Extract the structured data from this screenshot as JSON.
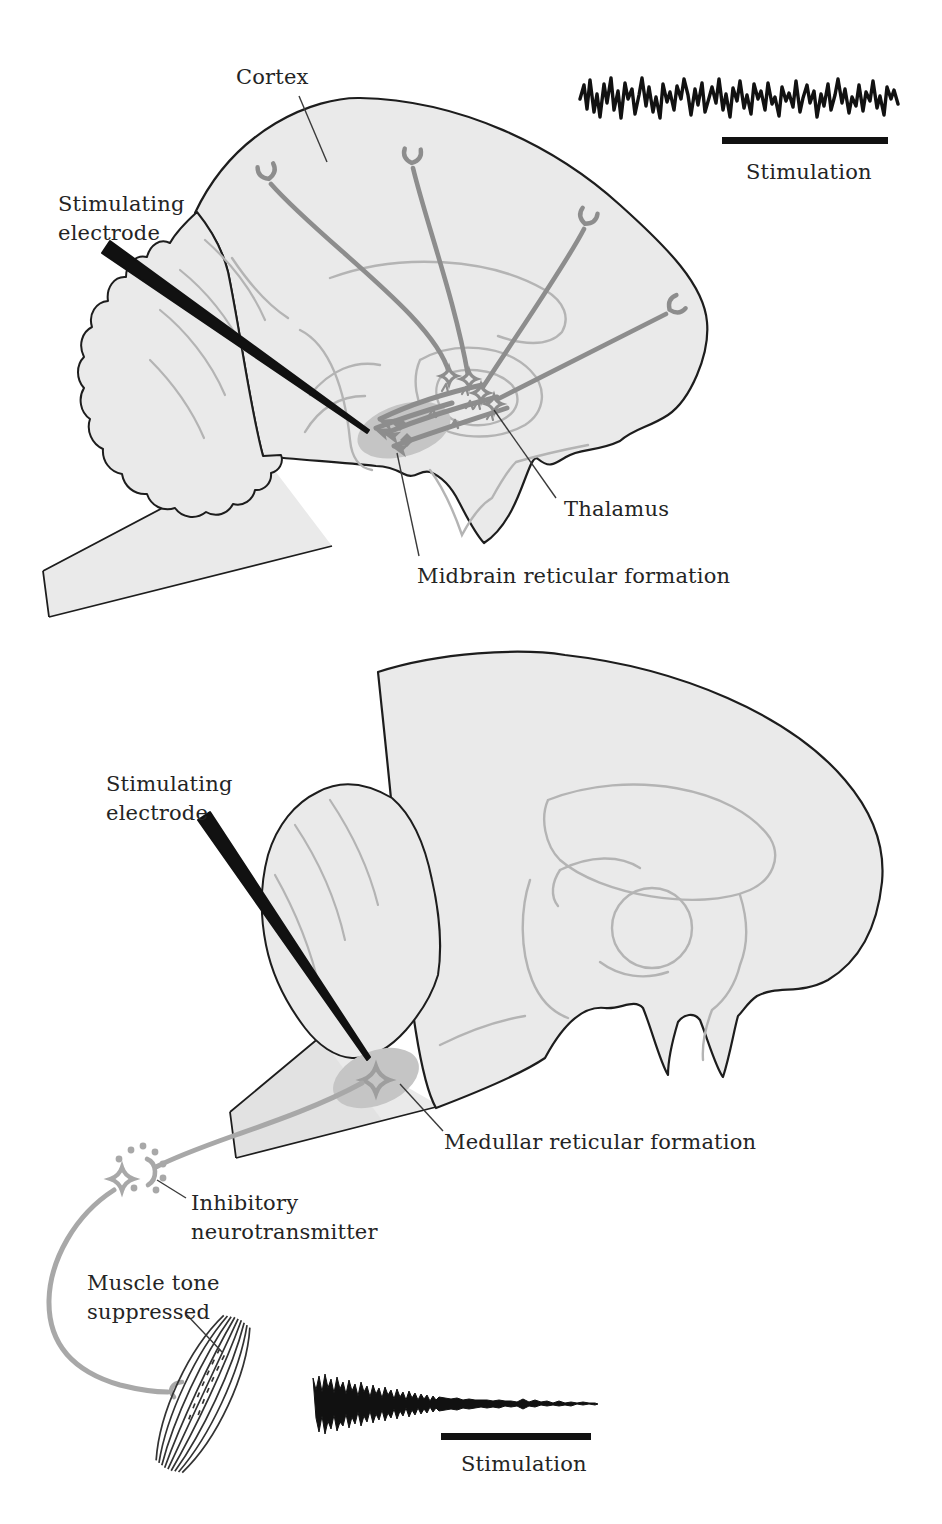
{
  "figure": {
    "type": "textbook-anatomy-diagram",
    "colors": {
      "background": "#ffffff",
      "brain_fill": "#eaeaea",
      "outline": "#1d1d1d",
      "internal_line": "#b4b4b4",
      "rf_shade": "#c5c5c5",
      "neuron_gray_dark": "#8d8d8d",
      "neuron_gray_light": "#a8a8a8",
      "electrode_black": "#111111",
      "trace_black": "#111111",
      "text": "#242424"
    }
  },
  "top_panel": {
    "labels": {
      "cortex": "Cortex",
      "stimulating_electrode_line1": "Stimulating",
      "stimulating_electrode_line2": "electrode",
      "thalamus": "Thalamus",
      "midbrain_rf": "Midbrain reticular formation",
      "stimulation": "Stimulation"
    },
    "icons": {
      "trace": "eeg-desynchronized-trace",
      "electrode": "stimulating-electrode-wedge",
      "axon_ending": "y-fork-cortical-terminal"
    }
  },
  "bottom_panel": {
    "labels": {
      "stimulating_electrode_line1": "Stimulating",
      "stimulating_electrode_line2": "electrode",
      "medullar_rf": "Medullar reticular formation",
      "inhibitory_line1": "Inhibitory",
      "inhibitory_line2": "neurotransmitter",
      "muscle_tone_line1": "Muscle tone",
      "muscle_tone_line2": "suppressed",
      "stimulation": "Stimulation"
    },
    "icons": {
      "trace": "emg-decaying-trace",
      "electrode": "stimulating-electrode-wedge",
      "neurotransmitter": "dot-cluster",
      "muscle": "muscle-spindle-fibers"
    }
  }
}
